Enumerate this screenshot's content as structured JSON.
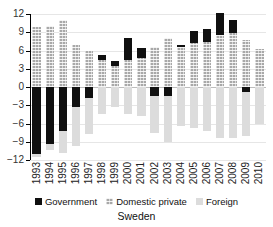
{
  "chart_data": {
    "type": "bar",
    "stacked": true,
    "title": "Sweden",
    "xlabel": "",
    "ylabel": "",
    "ylim": [
      -12,
      12
    ],
    "yticks": [
      12,
      9,
      6,
      3,
      0,
      -3,
      -6,
      -9,
      -12
    ],
    "ytick_labels": [
      "12",
      "9",
      "6",
      "3",
      "0",
      "−3",
      "−6",
      "−9",
      "−12"
    ],
    "grid": true,
    "legend_position": "bottom",
    "categories": [
      "1993",
      "1994",
      "1995",
      "1996",
      "1997",
      "1998",
      "1999",
      "2000",
      "2001",
      "2002",
      "2003",
      "2004",
      "2005",
      "2006",
      "2007",
      "2008",
      "2009",
      "2010"
    ],
    "series": [
      {
        "name": "Government",
        "color": "#101010",
        "values": [
          -11.0,
          -9.3,
          -7.3,
          -3.3,
          -1.8,
          0.9,
          0.8,
          3.6,
          1.6,
          -1.5,
          -1.4,
          0.4,
          2.0,
          2.2,
          3.6,
          2.2,
          -0.8,
          0.0
        ]
      },
      {
        "name": "Domestic private",
        "color": "#a8a8a8",
        "values": [
          9.9,
          10.0,
          11.0,
          6.9,
          6.0,
          4.4,
          3.5,
          4.4,
          4.8,
          6.6,
          8.1,
          6.5,
          7.2,
          7.4,
          8.6,
          8.8,
          7.7,
          6.3
        ]
      },
      {
        "name": "Foreign",
        "color": "#dcdcdc",
        "values": [
          -0.5,
          -1.1,
          -3.6,
          -6.4,
          -5.9,
          -4.4,
          -3.3,
          -4.5,
          -4.7,
          -6.0,
          -7.7,
          -6.4,
          -6.7,
          -7.2,
          -8.4,
          -8.4,
          -7.2,
          -6.1
        ]
      }
    ],
    "series_draw_order": [
      "Domestic private",
      "Government",
      "Foreign"
    ]
  },
  "legend": {
    "items": [
      {
        "label": "Government",
        "icon": "square-swatch-black"
      },
      {
        "label": "Domestic private",
        "icon": "square-swatch-hatched"
      },
      {
        "label": "Foreign",
        "icon": "square-swatch-light-gray"
      }
    ]
  }
}
